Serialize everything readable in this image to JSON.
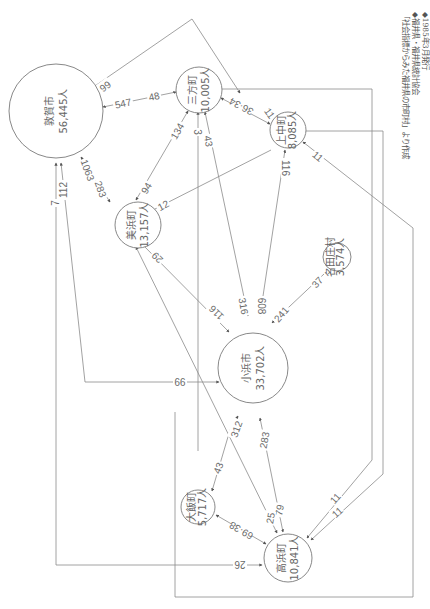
{
  "rotation_deg": 90,
  "source_note": {
    "line1": "「社会指標からみた福井県の市町村」より作成",
    "line2": "◆福井県・福井県統計協会",
    "line3": "◆1985年3月発行"
  },
  "nodes": [
    {
      "id": "tsuruga",
      "name": "敦賀市",
      "population": "56,445人"
    },
    {
      "id": "mikata",
      "name": "三方町",
      "population": "10,005人"
    },
    {
      "id": "kaminaka",
      "name": "上中町",
      "population": "8,085人"
    },
    {
      "id": "mihama",
      "name": "美浜町",
      "population": "13,157人"
    },
    {
      "id": "natashou",
      "name": "名田庄村",
      "population": "3,574人"
    },
    {
      "id": "obama",
      "name": "小浜市",
      "population": "33,702人"
    },
    {
      "id": "ooi",
      "name": "大飯町",
      "population": "5,717人"
    },
    {
      "id": "takahama",
      "name": "高浜町",
      "population": "10,841人"
    }
  ],
  "edges": [
    {
      "from": "kaminaka",
      "to": "tsuruga",
      "labels": [
        "99",
        "11"
      ]
    },
    {
      "from": "tsuruga",
      "to": "mikata",
      "labels": [
        "547",
        "48"
      ]
    },
    {
      "from": "tsuruga",
      "to": "mihama",
      "labels": [
        "1063",
        "283"
      ]
    },
    {
      "from": "mikata",
      "to": "mihama",
      "labels": [
        "134",
        "94"
      ]
    },
    {
      "from": "mikata",
      "to": "kaminaka",
      "labels": [
        "36",
        "34"
      ]
    },
    {
      "from": "kaminaka",
      "to": "mihama",
      "labels": [
        "12"
      ]
    },
    {
      "from": "mikata",
      "to": "obama",
      "labels": [
        "3",
        "43",
        "316"
      ]
    },
    {
      "from": "kaminaka",
      "to": "obama",
      "labels": [
        "116",
        "608"
      ]
    },
    {
      "from": "natashou",
      "to": "obama",
      "labels": [
        "37",
        "241"
      ]
    },
    {
      "from": "mihama",
      "to": "obama",
      "labels": [
        "29",
        "116"
      ]
    },
    {
      "from": "tsuruga",
      "to": "obama",
      "labels": [
        "112",
        "99"
      ]
    },
    {
      "from": "tsuruga",
      "to": "takahama",
      "labels": [
        "7",
        "26"
      ]
    },
    {
      "from": "obama",
      "to": "ooi",
      "labels": [
        "312",
        "43"
      ]
    },
    {
      "from": "obama",
      "to": "takahama",
      "labels": [
        "283",
        "79"
      ]
    },
    {
      "from": "mihama",
      "to": "takahama",
      "labels": [
        "25"
      ]
    },
    {
      "from": "ooi",
      "to": "takahama",
      "labels": [
        "38",
        "69"
      ]
    },
    {
      "from": "mikata",
      "to": "takahama",
      "labels": [
        "11"
      ]
    },
    {
      "from": "kaminaka",
      "to": "takahama",
      "labels": [
        "11"
      ]
    }
  ],
  "colors": {
    "line": "#8a8a8a",
    "text": "#666666",
    "background": "#ffffff"
  }
}
